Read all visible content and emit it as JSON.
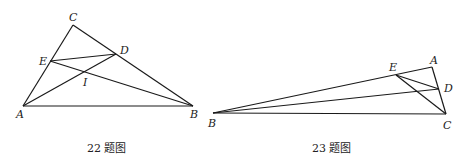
{
  "figures": [
    {
      "caption": "22 题图",
      "points": {
        "A": "A",
        "B": "B",
        "C": "C",
        "D": "D",
        "E": "E",
        "I": "I"
      }
    },
    {
      "caption": "23 题图",
      "points": {
        "A": "A",
        "B": "B",
        "C": "C",
        "D": "D",
        "E": "E"
      }
    }
  ],
  "colors": {
    "stroke": "#1a1a1a",
    "background": "#ffffff"
  }
}
